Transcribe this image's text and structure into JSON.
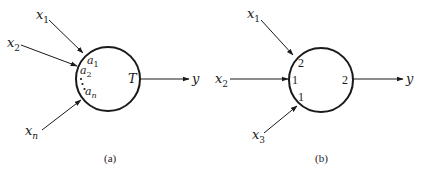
{
  "colors": {
    "ink": "#1a1a1a",
    "background": "#ffffff"
  },
  "diagram_a": {
    "caption": "(a)",
    "inputs": [
      {
        "label": "x",
        "subscript": "1",
        "weight_label": "a",
        "weight_subscript": "1"
      },
      {
        "label": "x",
        "subscript": "2",
        "weight_label": "a",
        "weight_subscript": "2"
      },
      {
        "label": "x",
        "subscript": "n",
        "weight_label": "a",
        "weight_subscript": "n"
      }
    ],
    "ellipsis": "⋮",
    "threshold_label": "T",
    "output_label": "y"
  },
  "diagram_b": {
    "caption": "(b)",
    "inputs": [
      {
        "label": "x",
        "subscript": "1",
        "weight": "2"
      },
      {
        "label": "x",
        "subscript": "2",
        "weight": "1"
      },
      {
        "label": "x",
        "subscript": "3",
        "weight": "1"
      }
    ],
    "threshold_label": "2",
    "output_label": "y"
  }
}
